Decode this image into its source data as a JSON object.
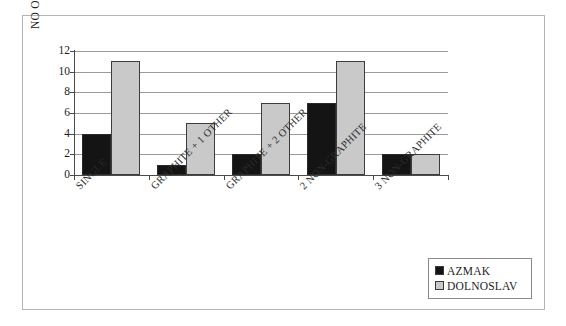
{
  "chart_data": {
    "type": "bar",
    "title": "",
    "xlabel": "",
    "ylabel": "NO OF CATEGORIES",
    "ylim": [
      0,
      12
    ],
    "yticks": [
      0,
      2,
      4,
      6,
      8,
      10,
      12
    ],
    "grid": true,
    "legend_position": "bottom-right",
    "categories": [
      "SINGLE",
      "GRAPHITE + 1 OTHER",
      "GRAPHITE + 2 OTHER",
      "2 NON-GRAPHITE",
      "3 NON-GRAPHITE"
    ],
    "series": [
      {
        "name": "AZMAK",
        "color": "#141414",
        "values": [
          4,
          1,
          2,
          7,
          2
        ]
      },
      {
        "name": "DOLNOSLAV",
        "color": "#c9c9c9",
        "values": [
          11,
          5,
          7,
          11,
          2
        ]
      }
    ]
  },
  "axis": {
    "y_title": "NO OF CATEGORIES",
    "y_tick_labels": [
      "12",
      "10",
      "8",
      "6",
      "4",
      "2",
      "0"
    ]
  },
  "legend": {
    "items": [
      {
        "label": "AZMAK"
      },
      {
        "label": "DOLNOSLAV"
      }
    ]
  }
}
